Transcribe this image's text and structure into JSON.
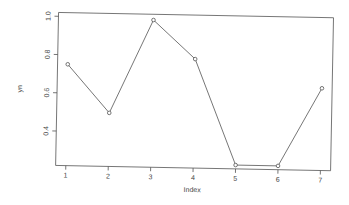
{
  "chart_data": {
    "type": "line",
    "title": "",
    "xlabel": "Index",
    "ylabel": "yn",
    "x": [
      1,
      2,
      3,
      4,
      5,
      6,
      7
    ],
    "values": [
      0.75,
      0.5,
      0.99,
      0.79,
      0.24,
      0.24,
      0.65
    ],
    "x_ticks": [
      "1",
      "2",
      "3",
      "4",
      "5",
      "6",
      "7"
    ],
    "y_ticks": [
      "0.4",
      "0.6",
      "0.8",
      "1.0"
    ],
    "xlim": [
      0.76,
      7.24
    ],
    "ylim": [
      0.22,
      1.02
    ],
    "grid": false,
    "legend": null,
    "marker": "open-circle",
    "line_color": "#555555"
  }
}
